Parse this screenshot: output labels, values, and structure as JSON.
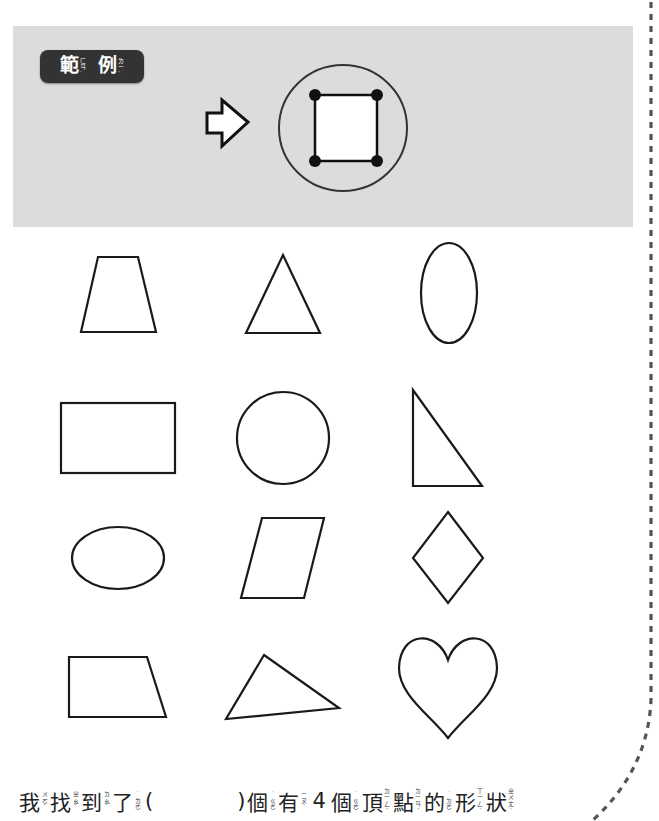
{
  "example": {
    "badge": {
      "words": [
        {
          "char": "範",
          "zhuyin": "ㄈㄢˋ"
        },
        {
          "char": "例",
          "zhuyin": "ㄌㄧˋ"
        }
      ]
    },
    "arrow_icon": "right-arrow-outline",
    "demo_shape": "square with 4 highlighted vertices inside a circle"
  },
  "shapes": [
    {
      "row": 1,
      "col": 1,
      "name": "trapezoid",
      "vertices": 4
    },
    {
      "row": 1,
      "col": 2,
      "name": "triangle",
      "vertices": 3
    },
    {
      "row": 1,
      "col": 3,
      "name": "vertical-ellipse",
      "vertices": 0
    },
    {
      "row": 2,
      "col": 1,
      "name": "rectangle",
      "vertices": 4
    },
    {
      "row": 2,
      "col": 2,
      "name": "circle",
      "vertices": 0
    },
    {
      "row": 2,
      "col": 3,
      "name": "right-triangle",
      "vertices": 3
    },
    {
      "row": 3,
      "col": 1,
      "name": "horizontal-ellipse",
      "vertices": 0
    },
    {
      "row": 3,
      "col": 2,
      "name": "parallelogram",
      "vertices": 4
    },
    {
      "row": 3,
      "col": 3,
      "name": "rhombus",
      "vertices": 4
    },
    {
      "row": 4,
      "col": 1,
      "name": "right-trapezoid",
      "vertices": 4
    },
    {
      "row": 4,
      "col": 2,
      "name": "scalene-triangle",
      "vertices": 3
    },
    {
      "row": 4,
      "col": 3,
      "name": "heart",
      "vertices": 0
    }
  ],
  "question": {
    "part1": [
      {
        "char": "我",
        "zhuyin": "ㄨㄛˇ"
      },
      {
        "char": "找",
        "zhuyin": "ㄓㄠˇ"
      },
      {
        "char": "到",
        "zhuyin": "ㄉㄠˋ"
      },
      {
        "char": "了",
        "zhuyin": "˙ㄌㄜ"
      }
    ],
    "open_paren": "(",
    "answer": "",
    "close_paren": ")",
    "part2": [
      {
        "char": "個",
        "zhuyin": "˙ㄍㄜ"
      },
      {
        "char": "有",
        "zhuyin": "ㄧㄡˇ"
      }
    ],
    "number": "4",
    "part3": [
      {
        "char": "個",
        "zhuyin": "˙ㄍㄜ"
      },
      {
        "char": "頂",
        "zhuyin": "ㄉㄧㄥˇ"
      },
      {
        "char": "點",
        "zhuyin": "ㄉㄧㄢˇ"
      },
      {
        "char": "的",
        "zhuyin": "˙ㄉㄜ"
      },
      {
        "char": "形",
        "zhuyin": "ㄒㄧㄥˊ"
      },
      {
        "char": "狀",
        "zhuyin": "ㄓㄨㄤˋ"
      }
    ]
  },
  "colors": {
    "panel": "#dcdcdc",
    "badge": "#333333",
    "stroke": "#1a1a1a",
    "dashed_border": "#555555"
  }
}
